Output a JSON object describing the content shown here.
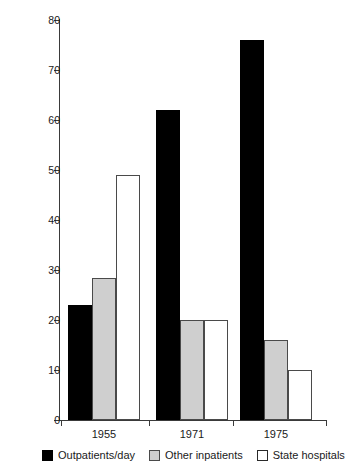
{
  "chart_data": {
    "type": "bar",
    "title": "",
    "subtitle": "",
    "xlabel": "",
    "ylabel": "Percent",
    "categories": [
      "1955",
      "1971",
      "1975"
    ],
    "series": [
      {
        "name": "Outpatients/day",
        "color": "#000000",
        "values": [
          23,
          62,
          76
        ]
      },
      {
        "name": "Other inpatients",
        "color": "#cfcfcf",
        "values": [
          28.5,
          20,
          16
        ]
      },
      {
        "name": "State hospitals",
        "color": "#ffffff",
        "values": [
          49,
          20,
          10
        ]
      }
    ],
    "ylim": [
      0,
      80
    ],
    "ytick_values": [
      0,
      10,
      20,
      30,
      40,
      50,
      60,
      70,
      80
    ],
    "ytick_labels": [
      "0",
      "10",
      "20",
      "30",
      "40",
      "50",
      "60",
      "70",
      "80"
    ],
    "grid": false,
    "legend_position": "bottom",
    "annotations": []
  },
  "axes": {
    "y_title": "Percent"
  },
  "legend": {
    "items": [
      {
        "label": "Outpatients/day",
        "swatch": "black-swatch-icon"
      },
      {
        "label": "Other inpatients",
        "swatch": "gray-swatch-icon"
      },
      {
        "label": "State hospitals",
        "swatch": "white-swatch-icon"
      }
    ]
  }
}
